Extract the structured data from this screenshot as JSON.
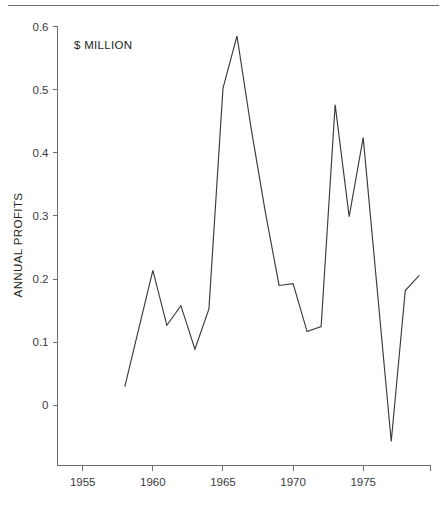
{
  "figure": {
    "unit_note": "$ MILLION",
    "top_clipped_text": "",
    "bottom_clipped_text": ""
  },
  "chart_data": {
    "type": "line",
    "title": "",
    "subtitle": "",
    "annotations": [
      "$ MILLION"
    ],
    "xlabel": "",
    "ylabel": "ANNUAL PROFITS",
    "xlim": [
      1953.2,
      1979.8
    ],
    "ylim": [
      -0.095,
      0.6
    ],
    "xticks": [
      1955,
      1960,
      1965,
      1970,
      1975
    ],
    "xtick_labels": [
      "1955",
      "1960",
      "1965",
      "1970",
      "1975"
    ],
    "yticks": [
      0,
      0.1,
      0.2,
      0.3,
      0.4,
      0.5,
      0.6
    ],
    "ytick_labels": [
      "0",
      "0.1",
      "0.2",
      "0.3",
      "0.4",
      "0.5",
      "0.6"
    ],
    "grid": false,
    "legend": false,
    "legend_position": "none",
    "x": [
      1958,
      1960,
      1961,
      1962,
      1963,
      1964,
      1965,
      1966,
      1967,
      1968,
      1969,
      1970,
      1971,
      1972,
      1973,
      1974,
      1975,
      1977,
      1978,
      1979
    ],
    "series": [
      {
        "name": "ANNUAL PROFITS",
        "color": "#3b3a3c",
        "values": [
          0.03,
          0.214,
          0.127,
          0.158,
          0.089,
          0.153,
          0.502,
          0.585,
          0.44,
          0.309,
          0.19,
          0.193,
          0.117,
          0.125,
          0.476,
          0.299,
          0.424,
          -0.057,
          0.182,
          0.206
        ]
      }
    ]
  }
}
